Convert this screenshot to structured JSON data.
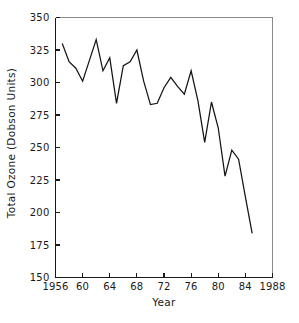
{
  "chart_data": {
    "type": "line",
    "title": "",
    "xlabel": "Year",
    "ylabel": "Total Ozone (Dobson Units)",
    "xlim": [
      1956,
      1988
    ],
    "ylim": [
      150,
      350
    ],
    "xticks": [
      1956,
      1960,
      1964,
      1968,
      1972,
      1976,
      1980,
      1984,
      1988
    ],
    "xtick_labels": [
      "1956",
      "60",
      "64",
      "68",
      "72",
      "76",
      "80",
      "84",
      "1988"
    ],
    "yticks": [
      150,
      175,
      200,
      225,
      250,
      275,
      300,
      325,
      350
    ],
    "ytick_labels": [
      "150",
      "175",
      "200",
      "225",
      "250",
      "275",
      "300",
      "325",
      "350"
    ],
    "grid": false,
    "legend": false,
    "legend_position": "none",
    "line_color": "#141414",
    "series": [
      {
        "name": "Total Ozone",
        "x": [
          1957,
          1958,
          1959,
          1960,
          1961,
          1962,
          1963,
          1964,
          1965,
          1966,
          1967,
          1968,
          1969,
          1970,
          1971,
          1972,
          1973,
          1974,
          1975,
          1976,
          1977,
          1978,
          1979,
          1980,
          1981,
          1982,
          1983,
          1984,
          1985
        ],
        "values": [
          330,
          316,
          311,
          301,
          317,
          333,
          309,
          319,
          284,
          313,
          316,
          325,
          301,
          283,
          284,
          296,
          304,
          297,
          291,
          309,
          286,
          254,
          285,
          265,
          228,
          248,
          241,
          212,
          184
        ]
      }
    ]
  }
}
